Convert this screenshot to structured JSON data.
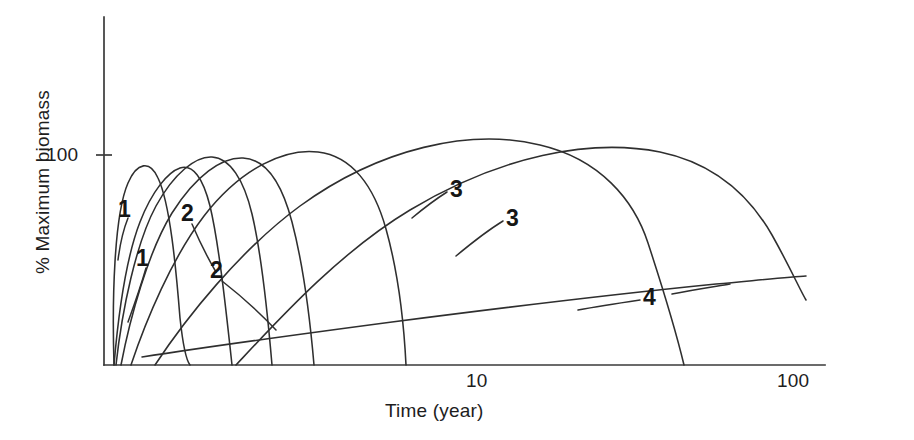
{
  "figure": {
    "background": "#ffffff",
    "ink_color": "#2f2f2f"
  },
  "axes": {
    "x_title": "Time (year)",
    "y_title": "% Maximum biomass",
    "x_ticks": [
      {
        "label": "10",
        "x": 480
      },
      {
        "label": "100",
        "x": 800
      }
    ],
    "y_ticks": [
      {
        "label": "100",
        "y": 155
      }
    ]
  },
  "curve_labels": [
    {
      "text": "1",
      "x": 118,
      "y": 196
    },
    {
      "text": "1",
      "x": 136,
      "y": 245
    },
    {
      "text": "2",
      "x": 181,
      "y": 200
    },
    {
      "text": "2",
      "x": 210,
      "y": 257
    },
    {
      "text": "3",
      "x": 450,
      "y": 176
    },
    {
      "text": "3",
      "x": 506,
      "y": 205
    },
    {
      "text": "4",
      "x": 643,
      "y": 284
    }
  ],
  "chart_data": {
    "type": "line",
    "title": "",
    "xlabel": "Time (year)",
    "ylabel": "% Maximum biomass",
    "xscale": "log",
    "xlim": [
      0.7,
      200
    ],
    "ylim": [
      0,
      175
    ],
    "x_tick_values": [
      10,
      100
    ],
    "y_tick_values": [
      100
    ],
    "grid": false,
    "legend": "inline-curve-labels",
    "series": [
      {
        "name": "1",
        "label": "1",
        "peak_time_year": 1.4,
        "peak_percent": 100,
        "start_time_year": 0.85,
        "end_time_year": 3.0,
        "points": [
          {
            "t": 0.85,
            "y": 0
          },
          {
            "t": 1.0,
            "y": 55
          },
          {
            "t": 1.2,
            "y": 90
          },
          {
            "t": 1.4,
            "y": 100
          },
          {
            "t": 1.8,
            "y": 88
          },
          {
            "t": 2.3,
            "y": 52
          },
          {
            "t": 3.0,
            "y": 0
          }
        ]
      },
      {
        "name": "1b",
        "label": "1",
        "peak_time_year": 1.5,
        "peak_percent": 93,
        "start_time_year": 0.9,
        "end_time_year": 3.4,
        "points": [
          {
            "t": 0.9,
            "y": 0
          },
          {
            "t": 1.05,
            "y": 40
          },
          {
            "t": 1.3,
            "y": 82
          },
          {
            "t": 1.5,
            "y": 93
          },
          {
            "t": 2.0,
            "y": 80
          },
          {
            "t": 2.6,
            "y": 45
          },
          {
            "t": 3.4,
            "y": 0
          }
        ]
      },
      {
        "name": "2",
        "label": "2",
        "peak_time_year": 2.2,
        "peak_percent": 100,
        "start_time_year": 0.95,
        "end_time_year": 5.2,
        "points": [
          {
            "t": 0.95,
            "y": 0
          },
          {
            "t": 1.3,
            "y": 48
          },
          {
            "t": 1.8,
            "y": 88
          },
          {
            "t": 2.2,
            "y": 100
          },
          {
            "t": 3.0,
            "y": 88
          },
          {
            "t": 4.0,
            "y": 52
          },
          {
            "t": 5.2,
            "y": 0
          }
        ]
      },
      {
        "name": "2b",
        "label": "2",
        "peak_time_year": 3.0,
        "peak_percent": 99,
        "start_time_year": 1.05,
        "end_time_year": 8.0,
        "points": [
          {
            "t": 1.05,
            "y": 0
          },
          {
            "t": 1.5,
            "y": 42
          },
          {
            "t": 2.2,
            "y": 85
          },
          {
            "t": 3.0,
            "y": 99
          },
          {
            "t": 4.3,
            "y": 86
          },
          {
            "t": 6.0,
            "y": 50
          },
          {
            "t": 8.0,
            "y": 0
          }
        ]
      },
      {
        "name": "3",
        "label": "3",
        "peak_time_year": 5.5,
        "peak_percent": 101,
        "start_time_year": 1.2,
        "end_time_year": 14,
        "points": [
          {
            "t": 1.2,
            "y": 0
          },
          {
            "t": 2.0,
            "y": 40
          },
          {
            "t": 3.5,
            "y": 85
          },
          {
            "t": 5.5,
            "y": 101
          },
          {
            "t": 8.0,
            "y": 88
          },
          {
            "t": 11.0,
            "y": 52
          },
          {
            "t": 14.0,
            "y": 0
          }
        ]
      },
      {
        "name": "3b",
        "label": "3",
        "peak_time_year": 22,
        "peak_percent": 104,
        "start_time_year": 1.4,
        "end_time_year": 105,
        "points": [
          {
            "t": 1.4,
            "y": 0
          },
          {
            "t": 3.0,
            "y": 33
          },
          {
            "t": 7.0,
            "y": 72
          },
          {
            "t": 13.0,
            "y": 95
          },
          {
            "t": 22.0,
            "y": 104
          },
          {
            "t": 45.0,
            "y": 82
          },
          {
            "t": 75.0,
            "y": 45
          },
          {
            "t": 105.0,
            "y": 0
          }
        ]
      },
      {
        "name": "3c",
        "label": "3",
        "peak_time_year": 35,
        "peak_percent": 100,
        "start_time_year": 2.6,
        "end_time_year": 140,
        "points": [
          {
            "t": 2.6,
            "y": 0
          },
          {
            "t": 6.0,
            "y": 32
          },
          {
            "t": 12.0,
            "y": 66
          },
          {
            "t": 22.0,
            "y": 91
          },
          {
            "t": 35.0,
            "y": 100
          },
          {
            "t": 65.0,
            "y": 88
          },
          {
            "t": 105.0,
            "y": 63
          },
          {
            "t": 140.0,
            "y": 38
          }
        ]
      },
      {
        "name": "4",
        "label": "4",
        "peak_time_year": 150,
        "peak_percent": 47,
        "start_time_year": 1.5,
        "end_time_year": 150,
        "points": [
          {
            "t": 1.5,
            "y": 2
          },
          {
            "t": 4.0,
            "y": 9
          },
          {
            "t": 10.0,
            "y": 18
          },
          {
            "t": 25.0,
            "y": 29
          },
          {
            "t": 60.0,
            "y": 40
          },
          {
            "t": 100.0,
            "y": 45
          },
          {
            "t": 150.0,
            "y": 47
          }
        ]
      }
    ]
  },
  "geometry": {
    "axis": {
      "x0": 104,
      "x1": 825,
      "y_top": 17,
      "y_bottom": 365
    },
    "paths": {
      "curve_1a": "M114,365 C112,300 114,215 128,183 C137,162 150,160 158,178 C170,203 176,268 180,318 C183,346 186,360 190,365",
      "curve_1b": "M114,365 C118,318 126,258 140,222 C152,191 168,172 180,168 C193,164 203,178 210,206 C219,244 226,310 232,365",
      "curve_2a": "M116,365 C122,310 136,243 156,206 C174,173 196,156 212,157 C230,158 244,180 252,214 C262,256 268,318 272,365",
      "curve_2b": "M121,365 C130,318 148,252 172,213 C196,175 222,157 243,158 C266,159 282,184 292,222 C304,268 311,330 314,365",
      "curve_3a": "M131,365 C146,320 172,258 204,216 C242,167 286,148 318,152 C352,156 374,186 386,229 C398,272 404,325 406,365",
      "curve_3b": "M155,365 C186,318 240,250 300,206 C380,148 470,128 540,145 C600,159 634,200 648,243 C666,298 678,340 684,365",
      "curve_3c": "M236,365 C280,318 340,252 410,210 C500,156 590,138 660,152 C718,164 752,200 772,235 C790,267 800,290 806,300",
      "curve_4": "M142,357 C200,348 286,336 392,322 C500,308 616,294 716,284 C760,280 790,277 806,276"
    },
    "leaders": {
      "label_1a": "M128,218 C124,228 120,244 118,260",
      "label_1b": "M146,268 C142,282 136,300 128,322",
      "label_2a": "M192,224 C198,238 206,255 216,272",
      "label_2b": "M222,281 C240,295 258,311 276,330",
      "label_3a": "M447,192 C436,199 424,208 412,218",
      "label_3b": "M503,221 C490,229 474,241 456,256",
      "label_4a": "M640,300 C620,303 600,306 578,310",
      "label_4b": "M672,294 C692,290 712,287 730,284"
    }
  }
}
